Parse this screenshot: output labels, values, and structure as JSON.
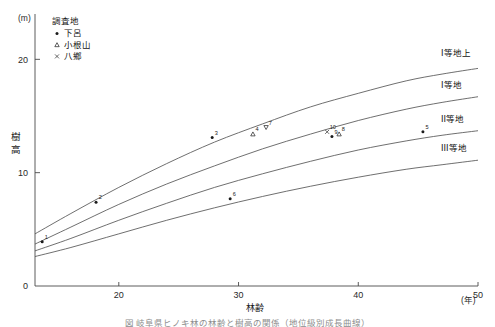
{
  "chart_data": {
    "type": "line",
    "title": "",
    "xlabel": "林齢",
    "ylabel": "樹高",
    "x_unit": "(年)",
    "y_unit": "(m)",
    "xlim": [
      13,
      50
    ],
    "ylim": [
      0,
      24
    ],
    "xticks": [
      20,
      30,
      40,
      50
    ],
    "xtick_labels": [
      "20",
      "30",
      "40",
      "50"
    ],
    "yticks": [
      0,
      10,
      20
    ],
    "ytick_labels": [
      "0",
      "10",
      "20"
    ],
    "grid": false,
    "legend_position": "top-left",
    "series": [
      {
        "name": "I等地上",
        "label": "I等地上",
        "x": [
          13,
          16,
          20,
          24,
          28,
          32,
          36,
          40,
          44,
          47,
          50
        ],
        "values": [
          4.6,
          6.4,
          8.7,
          10.8,
          12.7,
          14.3,
          15.8,
          17.0,
          18.1,
          18.7,
          19.2
        ]
      },
      {
        "name": "I等地",
        "label": "I等地",
        "x": [
          13,
          16,
          20,
          24,
          28,
          32,
          36,
          40,
          44,
          47,
          50
        ],
        "values": [
          3.7,
          5.2,
          7.2,
          9.0,
          10.6,
          12.1,
          13.4,
          14.6,
          15.6,
          16.2,
          16.7
        ]
      },
      {
        "name": "II等地",
        "label": "II等地",
        "x": [
          13,
          16,
          20,
          24,
          28,
          32,
          36,
          40,
          44,
          47,
          50
        ],
        "values": [
          3.1,
          4.2,
          5.8,
          7.3,
          8.7,
          9.9,
          11.0,
          12.0,
          12.8,
          13.3,
          13.7
        ]
      },
      {
        "name": "III等地",
        "label": "III等地",
        "x": [
          13,
          16,
          20,
          24,
          28,
          32,
          36,
          40,
          44,
          47,
          50
        ],
        "values": [
          2.6,
          3.4,
          4.6,
          5.8,
          6.9,
          7.9,
          8.8,
          9.6,
          10.3,
          10.7,
          11.1
        ]
      }
    ],
    "points": [
      {
        "label": "1",
        "x": 13.6,
        "y": 3.9,
        "marker": "dot"
      },
      {
        "label": "2",
        "x": 18.1,
        "y": 7.4,
        "marker": "dot"
      },
      {
        "label": "3",
        "x": 27.8,
        "y": 13.1,
        "marker": "dot"
      },
      {
        "label": "4",
        "x": 31.2,
        "y": 13.4,
        "marker": "triangle"
      },
      {
        "label": "7",
        "x": 32.3,
        "y": 14.0,
        "marker": "triangle-down"
      },
      {
        "label": "6",
        "x": 29.3,
        "y": 7.7,
        "marker": "dot"
      },
      {
        "label": "10",
        "x": 37.4,
        "y": 13.6,
        "marker": "x"
      },
      {
        "label": "9",
        "x": 37.8,
        "y": 13.2,
        "marker": "dot"
      },
      {
        "label": "8",
        "x": 38.4,
        "y": 13.4,
        "marker": "triangle"
      },
      {
        "label": "5",
        "x": 45.4,
        "y": 13.6,
        "marker": "dot"
      }
    ]
  },
  "legend": {
    "title": "調査地",
    "items": [
      {
        "marker": "dot",
        "label": "下呂"
      },
      {
        "marker": "triangle",
        "label": "小根山"
      },
      {
        "marker": "x",
        "label": "八鄉"
      }
    ]
  },
  "caption": {
    "text": "図  岐阜県ヒノキ林の林齢と樹高の関係（地位級別成長曲線）"
  },
  "colors": {
    "axis": "#4a4a4a",
    "curve": "#555555",
    "marker": "#1b1b1b",
    "text": "#1a1a1a"
  }
}
